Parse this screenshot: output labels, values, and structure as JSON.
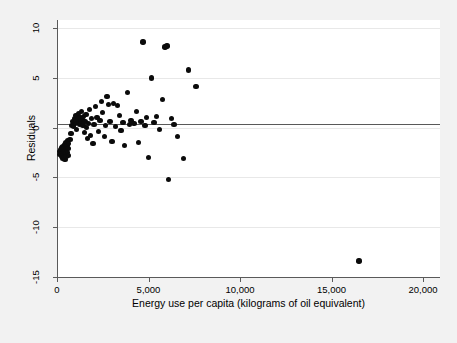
{
  "figure": {
    "background_color": "#f2f2f2",
    "plot_background_color": "#ffffff",
    "marker_color": "#0b0b0b",
    "gridline_color": "#e8e8e8",
    "axis_color": "#5a5a5a",
    "reference_line_color": "#595959"
  },
  "chart_data": {
    "type": "scatter",
    "title": "",
    "xlabel": "Energy use per capita (kilograms of oil equivalent)",
    "ylabel": "Residuals",
    "xlim": [
      0,
      20000
    ],
    "ylim": [
      -15,
      10
    ],
    "xticks": [
      0,
      5000,
      10000,
      15000,
      20000
    ],
    "xtick_labels": [
      "0",
      "5,000",
      "10,000",
      "15,000",
      "20,000"
    ],
    "yticks": [
      10,
      5,
      0,
      -5,
      -10,
      -15
    ],
    "ytick_labels": [
      "10",
      "5",
      "0",
      "-5",
      "-10",
      "-15"
    ],
    "grid": "horizontal",
    "legend": "none",
    "reference_line": {
      "orientation": "horizontal",
      "y": 0.35
    },
    "series": [
      {
        "name": "residuals",
        "marker": "filled-circle",
        "points": [
          [
            120,
            -2.4
          ],
          [
            170,
            -2.7
          ],
          [
            200,
            -2.2
          ],
          [
            230,
            -2.9
          ],
          [
            250,
            -2.0
          ],
          [
            270,
            -2.6
          ],
          [
            290,
            -3.1
          ],
          [
            300,
            -2.3
          ],
          [
            320,
            -1.9
          ],
          [
            330,
            -2.8
          ],
          [
            350,
            -2.5
          ],
          [
            360,
            -3.0
          ],
          [
            380,
            -2.1
          ],
          [
            395,
            -2.7
          ],
          [
            410,
            -1.7
          ],
          [
            420,
            -2.4
          ],
          [
            440,
            -3.2
          ],
          [
            455,
            -2.0
          ],
          [
            470,
            -2.6
          ],
          [
            480,
            -1.5
          ],
          [
            500,
            -2.9
          ],
          [
            520,
            -2.2
          ],
          [
            540,
            -1.8
          ],
          [
            560,
            -2.5
          ],
          [
            580,
            -1.3
          ],
          [
            600,
            -2.1
          ],
          [
            620,
            -2.8
          ],
          [
            640,
            -1.6
          ],
          [
            700,
            -1.2
          ],
          [
            760,
            -0.6
          ],
          [
            820,
            0.2
          ],
          [
            860,
            0.6
          ],
          [
            900,
            0.1
          ],
          [
            950,
            0.9
          ],
          [
            1000,
            0.4
          ],
          [
            1040,
            1.2
          ],
          [
            1080,
            -0.2
          ],
          [
            1120,
            0.7
          ],
          [
            1180,
            1.4
          ],
          [
            1220,
            0.3
          ],
          [
            1260,
            1.0
          ],
          [
            1300,
            0.5
          ],
          [
            1340,
            1.6
          ],
          [
            1380,
            0.8
          ],
          [
            1420,
            0.2
          ],
          [
            1460,
            1.1
          ],
          [
            1500,
            -0.5
          ],
          [
            1540,
            0.6
          ],
          [
            1580,
            1.3
          ],
          [
            1620,
            0.0
          ],
          [
            1680,
            -1.1
          ],
          [
            1720,
            0.4
          ],
          [
            1780,
            1.8
          ],
          [
            1840,
            -0.8
          ],
          [
            1900,
            0.9
          ],
          [
            1960,
            -1.6
          ],
          [
            2020,
            0.3
          ],
          [
            2100,
            2.1
          ],
          [
            2180,
            1.0
          ],
          [
            2260,
            -0.4
          ],
          [
            2340,
            0.7
          ],
          [
            2420,
            2.6
          ],
          [
            2500,
            1.5
          ],
          [
            2580,
            -0.9
          ],
          [
            2660,
            0.2
          ],
          [
            2740,
            3.1
          ],
          [
            2820,
            2.3
          ],
          [
            2900,
            0.6
          ],
          [
            3000,
            -1.4
          ],
          [
            3100,
            2.4
          ],
          [
            3200,
            0.1
          ],
          [
            3300,
            2.2
          ],
          [
            3400,
            1.2
          ],
          [
            3500,
            -0.3
          ],
          [
            3600,
            0.5
          ],
          [
            3700,
            -1.8
          ],
          [
            3850,
            3.5
          ],
          [
            3950,
            0.3
          ],
          [
            4050,
            0.7
          ],
          [
            4200,
            0.4
          ],
          [
            4350,
            1.6
          ],
          [
            4450,
            -1.5
          ],
          [
            4600,
            0.6
          ],
          [
            4700,
            8.6
          ],
          [
            4800,
            0.2
          ],
          [
            4900,
            1.0
          ],
          [
            5000,
            -3.0
          ],
          [
            5150,
            5.0
          ],
          [
            5300,
            0.5
          ],
          [
            5450,
            1.1
          ],
          [
            5600,
            -0.2
          ],
          [
            5750,
            2.8
          ],
          [
            5900,
            8.1
          ],
          [
            6000,
            8.2
          ],
          [
            6100,
            -5.2
          ],
          [
            6250,
            0.9
          ],
          [
            6400,
            0.3
          ],
          [
            6600,
            -0.9
          ],
          [
            6900,
            -3.1
          ],
          [
            7200,
            5.8
          ],
          [
            7600,
            4.1
          ],
          [
            16500,
            -13.4
          ]
        ]
      }
    ]
  },
  "axis_geometry": {
    "plot_left_px": 57,
    "plot_right_px": 423,
    "plot_top_px": 28,
    "plot_bottom_px": 277
  }
}
